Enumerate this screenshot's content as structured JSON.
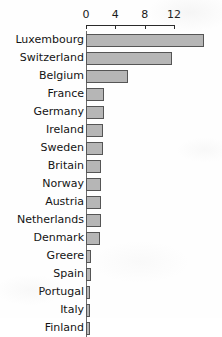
{
  "chart_data": {
    "type": "bar",
    "orientation": "horizontal",
    "title": "",
    "subtitle": "",
    "xlabel": "",
    "ylabel": "",
    "xlim": [
      0,
      16.5
    ],
    "xticks": [
      0,
      4,
      8,
      12
    ],
    "xtick_labels": [
      "0",
      "4",
      "8",
      "12"
    ],
    "grid": false,
    "legend": false,
    "legend_position": "none",
    "axis_position": "top",
    "categories": [
      "Luxembourg",
      "Switzerland",
      "Belgium",
      "France",
      "Germany",
      "Ireland",
      "Sweden",
      "Britain",
      "Norway",
      "Austria",
      "Netherlands",
      "Denmark",
      "Greere",
      "Spain",
      "Portugal",
      "Italy",
      "Finland"
    ],
    "values": [
      16.1,
      11.7,
      5.7,
      2.4,
      2.4,
      2.3,
      2.3,
      2.1,
      2.1,
      2.1,
      2.0,
      1.9,
      0.7,
      0.7,
      0.6,
      0.5,
      0.5
    ]
  },
  "style": {
    "bar_fill": "#b6b6b6",
    "bar_border": "#555555",
    "axis_color": "#2a2a2a",
    "text_color": "#141414",
    "background": "#fefefe"
  }
}
